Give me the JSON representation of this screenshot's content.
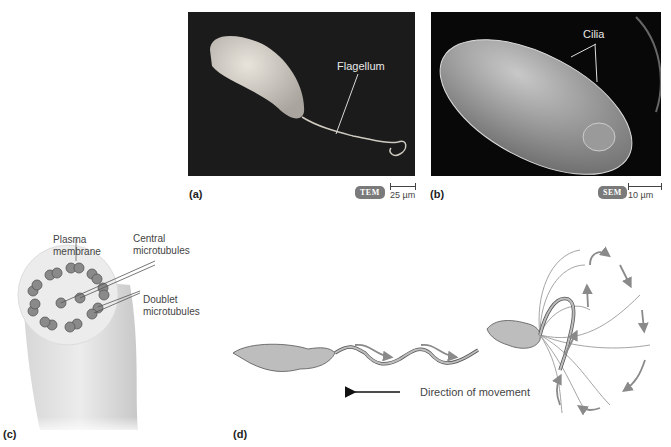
{
  "figure": {
    "panels": {
      "a": {
        "letter": "(a)",
        "label": "Flagellum",
        "badge": "TEM",
        "scale": "25 µm"
      },
      "b": {
        "letter": "(b)",
        "label": "Cilia",
        "badge": "SEM",
        "scale": "10 µm"
      },
      "c": {
        "letter": "(c)",
        "labels": {
          "plasma_membrane_1": "Plasma",
          "plasma_membrane_2": "membrane",
          "central_1": "Central",
          "central_2": "microtubules",
          "doublet_1": "Doublet",
          "doublet_2": "microtubules"
        }
      },
      "d": {
        "letter": "(d)",
        "direction_label": "Direction of movement"
      }
    },
    "colors": {
      "photo_bg": "#1b1b1b",
      "cell_fill": "#b8b8b8",
      "arrow_gray": "#8a8a8a",
      "badge_bg": "#7a7a7a"
    }
  }
}
